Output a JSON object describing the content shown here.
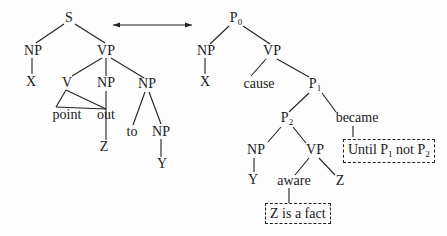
{
  "left_tree": {
    "root": "S",
    "np_subject": "NP",
    "x_subject": "X",
    "vp": "VP",
    "v": "V",
    "np_object": "NP",
    "np_pp": "NP",
    "point": "point",
    "out": "out",
    "z": "Z",
    "to": "to",
    "np_inner": "NP",
    "y": "Y"
  },
  "arrow": {
    "type": "double-headed",
    "meaning": "correspondence"
  },
  "right_tree": {
    "root": "P",
    "root_sub": "0",
    "np_subject": "NP",
    "x_subject": "X",
    "vp": "VP",
    "cause": "cause",
    "p1": "P",
    "p1_sub": "1",
    "p2": "P",
    "p2_sub": "2",
    "became": "became",
    "np2": "NP",
    "y": "Y",
    "vp2": "VP",
    "aware": "aware",
    "z": "Z",
    "box_until": {
      "prefix": "Until P",
      "sub1": "1",
      "mid": " not P",
      "sub2": "2"
    },
    "box_fact": "Z is a fact"
  }
}
